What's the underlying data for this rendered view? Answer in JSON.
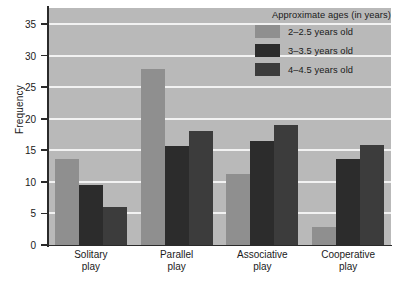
{
  "chart_data": {
    "type": "bar",
    "title": "",
    "xlabel": "",
    "ylabel": "Frequency",
    "ylim": [
      0,
      35
    ],
    "ytick_step": 5,
    "yticks": [
      0,
      5,
      10,
      15,
      20,
      25,
      30,
      35
    ],
    "grid": true,
    "grid_axis": "y",
    "legend_position": "top-right",
    "legend_title": "Approximate ages (in years)",
    "categories": [
      "Solitary\nplay",
      "Parallel\nplay",
      "Associative\nplay",
      "Cooperative\nplay"
    ],
    "series": [
      {
        "name": "2–2.5 years old",
        "color": "#8f8f8f",
        "values": [
          13.7,
          27.8,
          11.3,
          2.8
        ]
      },
      {
        "name": "3–3.5 years old",
        "color": "#2c2c2c",
        "values": [
          9.5,
          15.7,
          16.5,
          13.7
        ]
      },
      {
        "name": "4–4.5 years old",
        "color": "#3c3c3c",
        "values": [
          6.0,
          18.1,
          19.0,
          15.8
        ]
      }
    ],
    "colors": {
      "plot_background": "#b9b9b9",
      "gridline": "#f2f2f2",
      "axis": "#2a2a2a",
      "page_background": "#ffffff",
      "text": "#1a1a1a"
    }
  }
}
